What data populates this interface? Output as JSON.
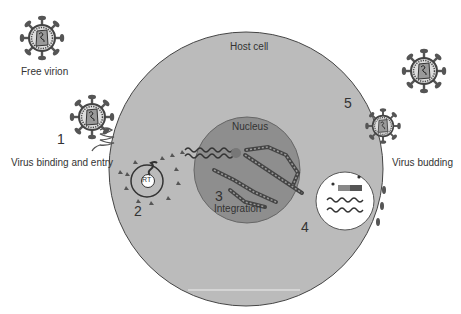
{
  "labels": {
    "free_virion": "Free virion",
    "host_cell": "Host cell",
    "nucleus": "Nucleus",
    "integration": "Integration",
    "virus_binding": "Virus binding and entry",
    "virus_budding": "Virus budding",
    "rt": "RT"
  },
  "steps": [
    "1",
    "2",
    "3",
    "4",
    "5"
  ],
  "colors": {
    "cell": "#b9b9b9",
    "nucleus": "#8e8e8e",
    "virion_spike": "#555555",
    "outline": "#444444"
  }
}
